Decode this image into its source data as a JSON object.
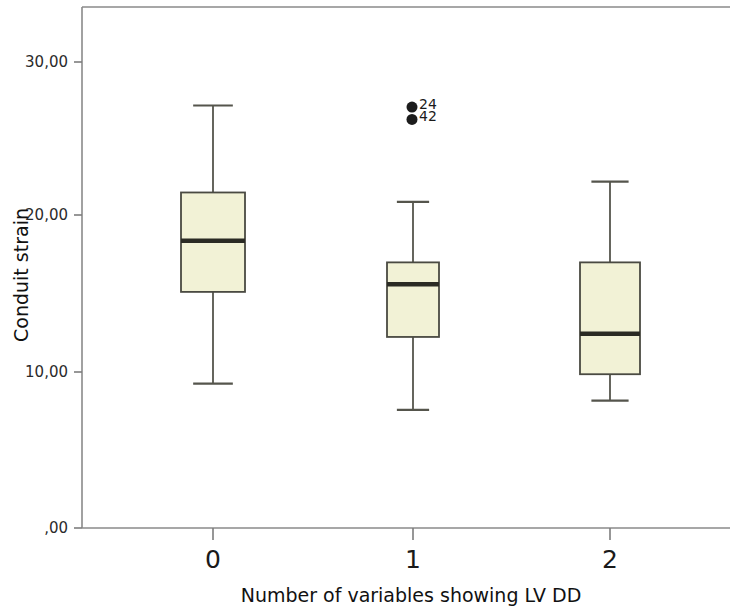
{
  "chart_data": {
    "type": "box",
    "title": "",
    "xlabel": "Number of variables showing LV DD",
    "ylabel": "Conduit strain",
    "categories": [
      "0",
      "1",
      "2"
    ],
    "ytick_labels": [
      "30,00",
      "20,00",
      "10,00",
      ",00"
    ],
    "ytick_values": [
      30,
      20,
      10,
      0
    ],
    "ylim": [
      0,
      33.7
    ],
    "grid": false,
    "legend": "none",
    "decimal_separator": ",",
    "boxes": [
      {
        "category": "0",
        "whisker_low": 9.3,
        "q1": 15.2,
        "median": 18.5,
        "q3": 21.6,
        "whisker_high": 27.2,
        "outliers": []
      },
      {
        "category": "1",
        "whisker_low": 7.6,
        "q1": 12.3,
        "median": 15.7,
        "q3": 17.1,
        "whisker_high": 21.0,
        "outliers": [
          {
            "label": "24",
            "value": 27.1
          },
          {
            "label": "42",
            "value": 26.3
          }
        ]
      },
      {
        "category": "2",
        "whisker_low": 8.2,
        "q1": 9.9,
        "median": 12.5,
        "q3": 17.1,
        "whisker_high": 22.3,
        "outliers": []
      }
    ],
    "colors": {
      "box_fill": "#f2f2d6",
      "box_border": "#4a4a42",
      "median": "#2b2b24",
      "whisker": "#55554c",
      "outlier": "#1c1c1c",
      "frame": "#8a8a8a",
      "background": "#ffffff"
    }
  }
}
